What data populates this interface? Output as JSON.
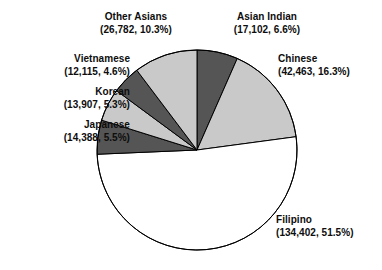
{
  "chart_data": {
    "type": "pie",
    "title": "",
    "subtitle": "",
    "xlabel": "",
    "ylabel": "",
    "legend_position": "none",
    "grid": false,
    "start_angle_deg": 90,
    "direction": "clockwise",
    "categories": [
      "Asian Indian",
      "Chinese",
      "Filipino",
      "Japanese",
      "Korean",
      "Vietnamese",
      "Other Asians"
    ],
    "values": [
      17102,
      42463,
      134402,
      14388,
      13907,
      12115,
      26782
    ],
    "percentages": [
      6.6,
      16.3,
      51.5,
      5.5,
      5.3,
      4.6,
      10.3
    ],
    "total": 261159,
    "slices": [
      {
        "name": "Asian Indian",
        "value": 17102,
        "value_text": "17,102",
        "percent": 6.6,
        "percent_text": "6.6%",
        "label": "Asian Indian",
        "value_label": "(17,102, 6.6%)",
        "color": "#555555",
        "order": 1
      },
      {
        "name": "Chinese",
        "value": 42463,
        "value_text": "42,463",
        "percent": 16.3,
        "percent_text": "16.3%",
        "label": "Chinese",
        "value_label": "(42,463, 16.3%)",
        "color": "#c9c9c9",
        "order": 2
      },
      {
        "name": "Filipino",
        "value": 134402,
        "value_text": "134,402",
        "percent": 51.5,
        "percent_text": "51.5%",
        "label": "Filipino",
        "value_label": "(134,402, 51.5%)",
        "color": "#ffffff",
        "order": 3
      },
      {
        "name": "Japanese",
        "value": 14388,
        "value_text": "14,388",
        "percent": 5.5,
        "percent_text": "5.5%",
        "label": "Japanese",
        "value_label": "(14,388, 5.5%)",
        "color": "#555555",
        "order": 4
      },
      {
        "name": "Korean",
        "value": 13907,
        "value_text": "13,907",
        "percent": 5.3,
        "percent_text": "5.3%",
        "label": "Korean",
        "value_label": "(13,907, 5.3%)",
        "color": "#c9c9c9",
        "order": 5
      },
      {
        "name": "Vietnamese",
        "value": 12115,
        "value_text": "12,115",
        "percent": 4.6,
        "percent_text": "4.6%",
        "label": "Vietnamese",
        "value_label": "(12,115, 4.6%)",
        "color": "#555555",
        "order": 6
      },
      {
        "name": "Other Asians",
        "value": 26782,
        "value_text": "26,782",
        "percent": 10.3,
        "percent_text": "10.3%",
        "label": "Other Asians",
        "value_label": "(26,782, 10.3%)",
        "color": "#c9c9c9",
        "order": 7
      }
    ],
    "colors": {
      "dark_gray": "#555555",
      "light_gray": "#c9c9c9",
      "white": "#ffffff",
      "outline": "#000000",
      "text": "#0d0d0d",
      "background": "#ffffff"
    },
    "geometry": {
      "center_x": 197,
      "center_y": 150,
      "radius": 100
    }
  }
}
